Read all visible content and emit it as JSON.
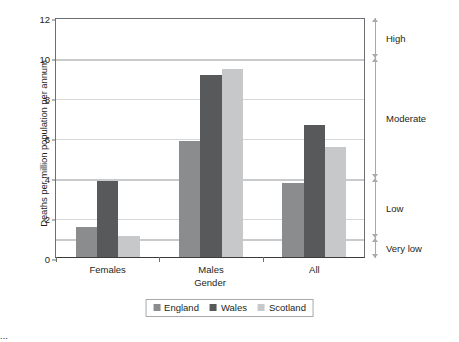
{
  "chart_data": {
    "type": "bar",
    "title": "",
    "categories": [
      "Females",
      "Males",
      "All"
    ],
    "series": [
      {
        "name": "England",
        "values": [
          1.5,
          5.8,
          3.7
        ],
        "color": "#8b8c8e"
      },
      {
        "name": "Wales",
        "values": [
          3.8,
          9.1,
          6.6
        ],
        "color": "#58595b"
      },
      {
        "name": "Scotland",
        "values": [
          1.05,
          9.4,
          5.5
        ],
        "color": "#c7c8ca"
      }
    ],
    "xlabel": "Gender",
    "ylabel": "Deaths per million population per annum",
    "ylim": [
      0,
      12
    ],
    "yticks": [
      0,
      2,
      4,
      6,
      8,
      10,
      12
    ],
    "ytick_labels": [
      "0",
      "2",
      "4",
      "6",
      "8",
      "10",
      "12"
    ],
    "grid": "horizontal",
    "legend_position": "bottom",
    "annotations": [
      {
        "label": "High",
        "from": 10,
        "to": 12
      },
      {
        "label": "Moderate",
        "from": 4,
        "to": 10
      },
      {
        "label": "Low",
        "from": 1,
        "to": 4
      },
      {
        "label": "Very low",
        "from": 0,
        "to": 1
      }
    ],
    "band_boundaries": [
      1,
      4,
      10
    ]
  },
  "caption": "...",
  "legend": {
    "items": [
      {
        "label": "England"
      },
      {
        "label": "Wales"
      },
      {
        "label": "Scotland"
      }
    ]
  }
}
